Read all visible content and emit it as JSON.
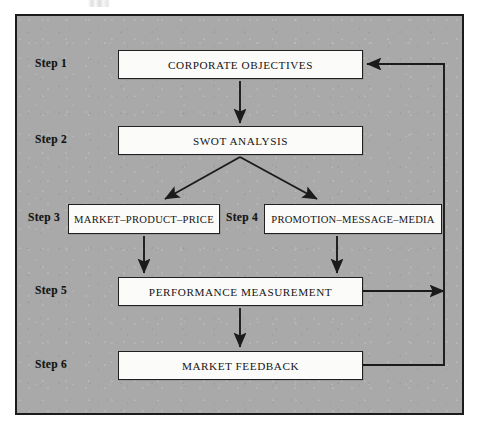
{
  "figure": {
    "type": "flowchart",
    "background_color": "#a9a9a9",
    "border_color": "#1b1b1b",
    "node_fill_color": "#fbfbfa",
    "line_color": "#1b1b1b"
  },
  "steps": [
    {
      "id": "step1",
      "label": "Step 1",
      "node": "CORPORATE OBJECTIVES"
    },
    {
      "id": "step2",
      "label": "Step 2",
      "node": "SWOT ANALYSIS"
    },
    {
      "id": "step3",
      "label": "Step 3",
      "node": "MARKET–PRODUCT–PRICE"
    },
    {
      "id": "step4",
      "label": "Step 4",
      "node": "PROMOTION–MESSAGE–MEDIA"
    },
    {
      "id": "step5",
      "label": "Step 5",
      "node": "PERFORMANCE MEASUREMENT"
    },
    {
      "id": "step6",
      "label": "Step 6",
      "node": "MARKET FEEDBACK"
    }
  ],
  "connections": [
    {
      "id": "c1",
      "from": "CORPORATE OBJECTIVES",
      "to": "SWOT ANALYSIS",
      "style": "straight-down-arrow"
    },
    {
      "id": "c2",
      "from": "SWOT ANALYSIS",
      "to": "MARKET–PRODUCT–PRICE",
      "style": "diagonal-down-left-arrow"
    },
    {
      "id": "c3",
      "from": "SWOT ANALYSIS",
      "to": "PROMOTION–MESSAGE–MEDIA",
      "style": "diagonal-down-right-arrow"
    },
    {
      "id": "c4",
      "from": "MARKET–PRODUCT–PRICE",
      "to": "PERFORMANCE MEASUREMENT",
      "style": "straight-down-arrow"
    },
    {
      "id": "c5",
      "from": "PROMOTION–MESSAGE–MEDIA",
      "to": "PERFORMANCE MEASUREMENT",
      "style": "straight-down-arrow"
    },
    {
      "id": "c6",
      "from": "PERFORMANCE MEASUREMENT",
      "to": "MARKET FEEDBACK",
      "style": "straight-down-arrow"
    },
    {
      "id": "c7",
      "from": "PERFORMANCE MEASUREMENT",
      "to": "feedback-bus",
      "style": "right-arrow"
    },
    {
      "id": "c8",
      "from": "MARKET FEEDBACK",
      "to": "CORPORATE OBJECTIVES",
      "style": "right-up-left-arrow"
    }
  ]
}
